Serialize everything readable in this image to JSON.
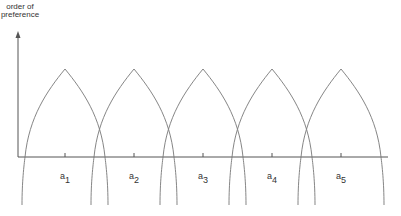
{
  "diagram": {
    "y_axis_label_line1": "order of",
    "y_axis_label_line2": "preference",
    "alternatives": [
      {
        "letter": "a",
        "index": "1",
        "center_x": 65
      },
      {
        "letter": "a",
        "index": "2",
        "center_x": 134
      },
      {
        "letter": "a",
        "index": "3",
        "center_x": 203
      },
      {
        "letter": "a",
        "index": "4",
        "center_x": 272
      },
      {
        "letter": "a",
        "index": "5",
        "center_x": 341
      }
    ],
    "axis": {
      "origin_x": 18,
      "origin_y": 157,
      "x_end": 388,
      "y_top": 31
    },
    "peak_y": 69,
    "base_half_width": 40,
    "curve_bottom_y": 205,
    "colors": {
      "line": "#555555",
      "curve": "#777777",
      "text": "#333333"
    }
  }
}
